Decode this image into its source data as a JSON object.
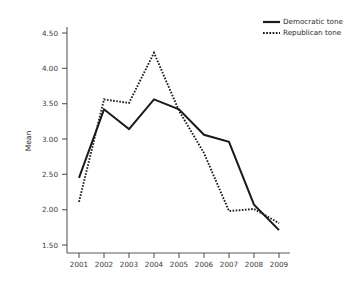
{
  "chart_data": {
    "type": "line",
    "title": "",
    "subtitle": "",
    "xlabel": "",
    "ylabel": "Mean",
    "x": [
      "2001",
      "2002",
      "2003",
      "2004",
      "2005",
      "2006",
      "2007",
      "2008",
      "2009"
    ],
    "categories": [
      "2001",
      "2002",
      "2003",
      "2004",
      "2005",
      "2006",
      "2007",
      "2008",
      "2009"
    ],
    "series": [
      {
        "name": "Democratic tone",
        "style": "solid",
        "color": "#1a1a1a",
        "values": [
          2.45,
          3.42,
          3.14,
          3.56,
          3.42,
          3.06,
          2.96,
          2.07,
          1.71
        ]
      },
      {
        "name": "Republican tone",
        "style": "dotted",
        "color": "#1a1a1a",
        "values": [
          2.11,
          3.56,
          3.51,
          4.22,
          3.4,
          2.8,
          1.98,
          2.01,
          1.81
        ]
      }
    ],
    "ylim": [
      1.35,
      4.7
    ],
    "yticks": [
      1.5,
      2.0,
      2.5,
      3.0,
      3.5,
      4.0,
      4.5
    ],
    "ytick_labels": [
      "1.50",
      "2.00",
      "2.50",
      "3.00",
      "3.50",
      "4.00",
      "4.50"
    ],
    "xtick_labels": [
      "2001",
      "2002",
      "2003",
      "2004",
      "2005",
      "2006",
      "2007",
      "2008",
      "2009"
    ],
    "grid": false,
    "legend_position": "top-right",
    "legend": [
      {
        "label": "Democratic tone",
        "style": "solid"
      },
      {
        "label": "Republican tone",
        "style": "dotted"
      }
    ]
  }
}
